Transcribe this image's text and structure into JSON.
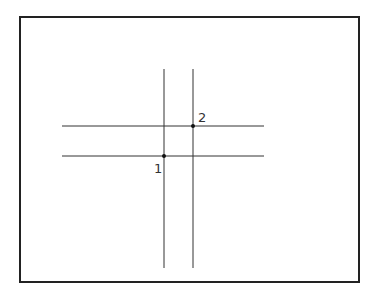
{
  "diagram": {
    "frame": {
      "x": 20,
      "y": 17,
      "width": 339,
      "height": 265,
      "stroke": "#222222"
    },
    "vertical_lines": [
      {
        "x": 164,
        "y1": 69,
        "y2": 268
      },
      {
        "x": 193,
        "y1": 69,
        "y2": 268
      }
    ],
    "horizontal_lines": [
      {
        "y": 126,
        "x1": 62,
        "x2": 264
      },
      {
        "y": 156,
        "x1": 62,
        "x2": 264
      }
    ],
    "points": [
      {
        "label": "1",
        "x": 164,
        "y": 156,
        "label_x": 154,
        "label_y": 173
      },
      {
        "label": "2",
        "x": 193,
        "y": 126,
        "label_x": 198,
        "label_y": 122
      }
    ],
    "line_color": "#333333"
  }
}
